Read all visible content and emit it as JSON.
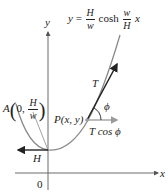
{
  "diagram": {
    "title_equation": {
      "lhs": "y",
      "eq": "=",
      "frac1_num": "H",
      "frac1_den": "w",
      "func": "cosh",
      "frac2_num": "w",
      "frac2_den": "H",
      "var": "x"
    },
    "axes": {
      "y_label": "y",
      "x_label": "x",
      "origin_label": "0"
    },
    "point_A": {
      "name": "A",
      "coord_x": "0,",
      "coord_y_num": "H",
      "coord_y_den": "w"
    },
    "point_P": {
      "label": "P(x, y)"
    },
    "vectors": {
      "tension": "T",
      "horizontal_component": "T cos ϕ",
      "horizontal_tension_at_A": "H",
      "angle": "ϕ"
    },
    "colors": {
      "curve": "#8a8a8a",
      "axis": "#6a6a6a",
      "arrow_dark": "#222222",
      "arrow_light": "#9a9a9a"
    }
  }
}
